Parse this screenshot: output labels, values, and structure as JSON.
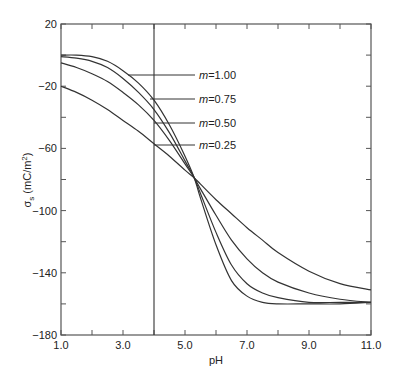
{
  "chart_data": {
    "type": "line",
    "title": "",
    "xlabel": "pH",
    "ylabel_main": "σ",
    "ylabel_sub": "s",
    "ylabel_unit": " (mC/m",
    "ylabel_sup": "2",
    "ylabel_close": ")",
    "xlim": [
      1.0,
      11.0
    ],
    "ylim": [
      -180,
      20
    ],
    "xticks": [
      1.0,
      2.0,
      3.0,
      4.0,
      5.0,
      6.0,
      7.0,
      8.0,
      9.0,
      10.0,
      11.0
    ],
    "xtick_labels": [
      {
        "value": 1.0,
        "label": "1.0"
      },
      {
        "value": 3.0,
        "label": "3.0"
      },
      {
        "value": 5.0,
        "label": "5.0"
      },
      {
        "value": 7.0,
        "label": "7.0"
      },
      {
        "value": 9.0,
        "label": "9.0"
      },
      {
        "value": 11.0,
        "label": "11.0"
      }
    ],
    "yticks": [
      20,
      0,
      -20,
      -40,
      -60,
      -80,
      -100,
      -120,
      -140,
      -160,
      -180
    ],
    "ytick_labels": [
      {
        "value": 20,
        "label": "20"
      },
      {
        "value": -20,
        "label": "−20"
      },
      {
        "value": -60,
        "label": "−60"
      },
      {
        "value": -100,
        "label": "−100"
      },
      {
        "value": -140,
        "label": "−140"
      },
      {
        "value": -180,
        "label": "−180"
      }
    ],
    "vertical_line_x": 4.0,
    "grid": false,
    "legend_placement": "inline-annotations",
    "series": [
      {
        "name": "m=1.00",
        "label_prefix": "m",
        "label_value": "=1.00",
        "x": [
          1.0,
          1.5,
          2.0,
          2.5,
          3.0,
          3.5,
          4.0,
          4.5,
          5.0,
          5.3,
          5.5,
          6.0,
          6.5,
          7.0,
          7.5,
          8.0,
          9.0,
          10.0,
          11.0
        ],
        "y": [
          0,
          0,
          -1,
          -4,
          -10,
          -18,
          -29,
          -45,
          -65,
          -79,
          -92,
          -122,
          -145,
          -155,
          -159,
          -160,
          -160,
          -160,
          -159
        ]
      },
      {
        "name": "m=0.75",
        "label_prefix": "m",
        "label_value": "=0.75",
        "x": [
          1.0,
          1.5,
          2.0,
          2.5,
          3.0,
          3.5,
          4.0,
          4.5,
          5.0,
          5.3,
          5.5,
          6.0,
          6.5,
          7.0,
          7.5,
          8.0,
          9.0,
          10.0,
          11.0
        ],
        "y": [
          -1,
          -2,
          -4,
          -8,
          -15,
          -24,
          -35,
          -50,
          -68,
          -79,
          -89,
          -114,
          -135,
          -147,
          -153,
          -156,
          -159,
          -159,
          -159
        ]
      },
      {
        "name": "m=0.50",
        "label_prefix": "m",
        "label_value": "=0.50",
        "x": [
          1.0,
          1.5,
          2.0,
          2.5,
          3.0,
          3.5,
          4.0,
          4.5,
          5.0,
          5.3,
          5.5,
          6.0,
          6.5,
          7.0,
          7.5,
          8.0,
          9.0,
          10.0,
          11.0
        ],
        "y": [
          -5,
          -8,
          -12,
          -17,
          -24,
          -32,
          -42,
          -55,
          -70,
          -79,
          -86,
          -103,
          -119,
          -131,
          -140,
          -146,
          -153,
          -157,
          -159
        ]
      },
      {
        "name": "m=0.25",
        "label_prefix": "m",
        "label_value": "=0.25",
        "x": [
          1.0,
          1.5,
          2.0,
          2.5,
          3.0,
          3.5,
          4.0,
          4.5,
          5.0,
          5.3,
          5.5,
          6.0,
          6.5,
          7.0,
          7.5,
          8.0,
          9.0,
          10.0,
          11.0
        ],
        "y": [
          -20,
          -24,
          -29,
          -35,
          -42,
          -49,
          -57,
          -65,
          -74,
          -79,
          -83,
          -93,
          -102,
          -111,
          -119,
          -127,
          -139,
          -147,
          -151
        ]
      }
    ]
  }
}
